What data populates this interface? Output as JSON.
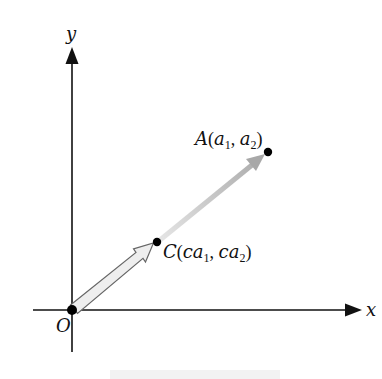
{
  "figure": {
    "axes": {
      "x_label": "x",
      "y_label": "y",
      "origin_label": "O"
    },
    "points": [
      {
        "id": "A",
        "name": "A",
        "coords": [
          "a",
          "1",
          "a",
          "2"
        ],
        "label_text": "A(a1, a2)"
      },
      {
        "id": "C",
        "name": "C",
        "coords": [
          "ca",
          "1",
          "ca",
          "2"
        ],
        "label_text": "C(ca1, ca2)"
      }
    ],
    "vectors": [
      {
        "from": "O",
        "to": "C",
        "style": "hollow-outline"
      },
      {
        "from": "C",
        "to": "A",
        "style": "gray-gradient"
      }
    ],
    "colors": {
      "axis": "#111111",
      "point": "#000000",
      "vector_ca": "#bdbdbd",
      "vector_oc_fill": "#eeeeee",
      "vector_oc_stroke": "#666666"
    }
  }
}
